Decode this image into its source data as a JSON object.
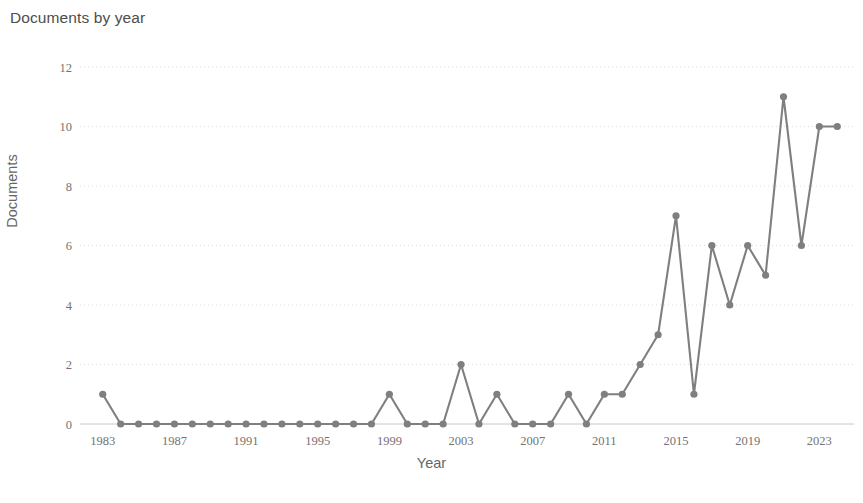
{
  "chart": {
    "title": "Documents by year",
    "caption": ""
  },
  "chart_data": {
    "type": "line",
    "title": "Documents by year",
    "xlabel": "Year",
    "ylabel": "Documents",
    "x": [
      1983,
      1984,
      1985,
      1986,
      1987,
      1988,
      1989,
      1990,
      1991,
      1992,
      1993,
      1994,
      1995,
      1996,
      1997,
      1998,
      1999,
      2000,
      2001,
      2002,
      2003,
      2004,
      2005,
      2006,
      2007,
      2008,
      2009,
      2010,
      2011,
      2012,
      2013,
      2014,
      2015,
      2016,
      2017,
      2018,
      2019,
      2020,
      2021,
      2022,
      2023,
      2024
    ],
    "values": [
      1,
      0,
      0,
      0,
      0,
      0,
      0,
      0,
      0,
      0,
      0,
      0,
      0,
      0,
      0,
      0,
      1,
      0,
      0,
      0,
      2,
      0,
      1,
      0,
      0,
      0,
      1,
      0,
      1,
      1,
      2,
      3,
      7,
      1,
      6,
      4,
      6,
      5,
      11,
      6,
      10,
      10
    ],
    "xtick_labels": [
      "1983",
      "1987",
      "1991",
      "1995",
      "1999",
      "2003",
      "2007",
      "2011",
      "2015",
      "2019",
      "2023"
    ],
    "xtick_values": [
      1983,
      1987,
      1991,
      1995,
      1999,
      2003,
      2007,
      2011,
      2015,
      2019,
      2023
    ],
    "ytick_labels": [
      "0",
      "2",
      "4",
      "6",
      "8",
      "10",
      "12"
    ],
    "ytick_values": [
      0,
      2,
      4,
      6,
      8,
      10,
      12
    ],
    "xlim": [
      1982.4,
      2024.6
    ],
    "ylim": [
      0,
      12
    ],
    "grid": true,
    "legend": "none",
    "series_color": "#7f7f7f",
    "marker": "circle"
  }
}
